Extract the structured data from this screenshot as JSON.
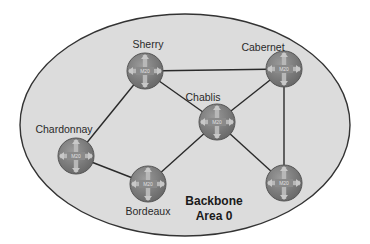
{
  "diagram": {
    "area_label_line1": "Backbone",
    "area_label_line2": "Area 0",
    "routers": [
      {
        "id": "sherry",
        "label": "Sherry",
        "model": "M20"
      },
      {
        "id": "cabernet",
        "label": "Cabernet",
        "model": "M20"
      },
      {
        "id": "chablis",
        "label": "Chablis",
        "model": "M20"
      },
      {
        "id": "chardonnay",
        "label": "Chardonnay",
        "model": "M20"
      },
      {
        "id": "bordeaux",
        "label": "Bordeaux",
        "model": "M20"
      },
      {
        "id": "unlabeled",
        "label": "",
        "model": "M20"
      }
    ],
    "links": [
      [
        "Sherry",
        "Cabernet"
      ],
      [
        "Sherry",
        "Chablis"
      ],
      [
        "Sherry",
        "Chardonnay"
      ],
      [
        "Cabernet",
        "Chablis"
      ],
      [
        "Cabernet",
        "unlabeled"
      ],
      [
        "Chablis",
        "Bordeaux"
      ],
      [
        "Chablis",
        "unlabeled"
      ],
      [
        "Chardonnay",
        "Bordeaux"
      ]
    ],
    "colors": {
      "area_fill": "#dcdcdc",
      "area_stroke": "#333333",
      "router_fill": "#7a7a7a",
      "link": "#2a2a2a"
    }
  }
}
